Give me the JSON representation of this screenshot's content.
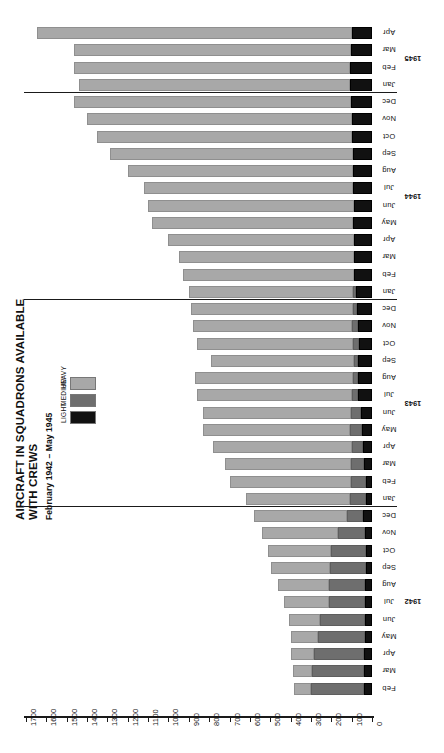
{
  "chart": {
    "title": "AIRCRAFT IN SQUADRONS AVAILABLE WITH CREWS",
    "subtitle": "February 1942 – May 1945"
  },
  "legend": {
    "position": "top-left",
    "items": [
      {
        "label": "LIGHT",
        "color": "#111111"
      },
      {
        "label": "MEDIUM",
        "color": "#6e6e6e"
      },
      {
        "label": "HEAVY",
        "color": "#a8a8a8"
      }
    ]
  },
  "axis": {
    "ticks": [
      "1700",
      "1600",
      "1500",
      "1400",
      "1300",
      "1200",
      "1100",
      "1000",
      "900",
      "800",
      "700",
      "600",
      "500",
      "400",
      "300",
      "200",
      "100",
      "0"
    ],
    "min": 0,
    "max": 1700,
    "step": 100,
    "direction": "right-to-left"
  },
  "years": [
    {
      "label": "1945"
    },
    {
      "label": "1944"
    },
    {
      "label": "1943"
    },
    {
      "label": "1942"
    }
  ],
  "chart_data": {
    "type": "bar",
    "orientation": "horizontal-stacked",
    "title": "AIRCRAFT IN SQUADRONS AVAILABLE WITH CREWS",
    "subtitle": "February 1942 – May 1945",
    "xlabel": "",
    "ylabel": "",
    "xlim": [
      0,
      1700
    ],
    "grid": false,
    "legend_position": "top-left",
    "categories": [
      "Apr 1945",
      "Mar 1945",
      "Feb 1945",
      "Jan 1945",
      "Dec 1944",
      "Nov 1944",
      "Oct 1944",
      "Sep 1944",
      "Aug 1944",
      "Jul 1944",
      "Jun 1944",
      "May 1944",
      "Apr 1944",
      "Mar 1944",
      "Feb 1944",
      "Jan 1944",
      "Dec 1943",
      "Nov 1943",
      "Oct 1943",
      "Sep 1943",
      "Aug 1943",
      "Jul 1943",
      "Jun 1943",
      "May 1943",
      "Apr 1943",
      "Mar 1943",
      "Feb 1943",
      "Jan 1943",
      "Dec 1942",
      "Nov 1942",
      "Oct 1942",
      "Sep 1942",
      "Aug 1942",
      "Jul 1942",
      "Jun 1942",
      "May 1942",
      "Apr 1942",
      "Mar 1942",
      "Feb 1942"
    ],
    "month_labels": [
      "Apr",
      "Mar",
      "Feb",
      "Jan",
      "Dec",
      "Nov",
      "Oct",
      "Sep",
      "Aug",
      "Jul",
      "Jun",
      "May",
      "Apr",
      "Mar",
      "Feb",
      "Jan",
      "Dec",
      "Nov",
      "Oct",
      "Sep",
      "Aug",
      "Jul",
      "Jun",
      "May",
      "Apr",
      "Mar",
      "Feb",
      "Jan",
      "Dec",
      "Nov",
      "Oct",
      "Sep",
      "Aug",
      "Jul",
      "Jun",
      "May",
      "Apr",
      "Mar",
      "Feb"
    ],
    "series": [
      {
        "name": "HEAVY",
        "color": "#a8a8a8",
        "values": [
          1545,
          1360,
          1355,
          1330,
          1360,
          1300,
          1250,
          1190,
          1105,
          1025,
          1010,
          985,
          910,
          860,
          840,
          805,
          795,
          780,
          765,
          700,
          775,
          760,
          725,
          720,
          680,
          615,
          595,
          510,
          455,
          375,
          310,
          290,
          250,
          220,
          155,
          135,
          115,
          95,
          85
        ]
      },
      {
        "name": "MEDIUM",
        "color": "#6e6e6e",
        "values": [
          0,
          0,
          0,
          0,
          0,
          0,
          0,
          0,
          0,
          0,
          0,
          0,
          0,
          0,
          0,
          15,
          20,
          30,
          30,
          20,
          25,
          30,
          50,
          60,
          55,
          65,
          75,
          80,
          80,
          130,
          170,
          175,
          175,
          175,
          220,
          230,
          245,
          255,
          260
        ]
      },
      {
        "name": "LIGHT",
        "color": "#111111",
        "values": [
          100,
          105,
          110,
          110,
          105,
          100,
          100,
          95,
          95,
          95,
          90,
          95,
          90,
          90,
          90,
          80,
          75,
          70,
          65,
          70,
          70,
          70,
          55,
          50,
          45,
          40,
          30,
          30,
          45,
          35,
          30,
          30,
          35,
          35,
          35,
          35,
          40,
          40,
          40
        ]
      }
    ],
    "totals": [
      1645,
      1465,
      1465,
      1440,
      1465,
      1400,
      1350,
      1285,
      1200,
      1120,
      1100,
      1080,
      1000,
      950,
      930,
      900,
      890,
      880,
      860,
      790,
      870,
      860,
      830,
      830,
      780,
      720,
      700,
      620,
      580,
      540,
      510,
      495,
      460,
      430,
      410,
      400,
      400,
      390,
      385
    ]
  }
}
